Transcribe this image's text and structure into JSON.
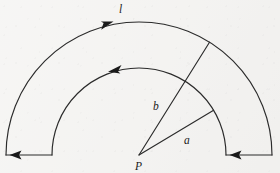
{
  "figure": {
    "type": "geometry-diagram",
    "background_color": "#f4f3f1",
    "ink_color": "#2b2b2b",
    "labels": {
      "arc_length": "l",
      "inner_radius": "a",
      "outer_radius": "b",
      "center_point": "P"
    },
    "geometry": {
      "center": {
        "x": 139,
        "y": 155
      },
      "outer_radius": 133,
      "inner_radius": 87,
      "start_angle_deg": 0,
      "end_angle_deg": 180,
      "radial_line_b_angle_deg": 58,
      "radial_line_a_angle_deg": 31
    },
    "arrows": [
      {
        "name": "outer-arc-arrow",
        "x": 108,
        "y": 25,
        "direction": "clockwise-right"
      },
      {
        "name": "inner-arc-arrow",
        "x": 116,
        "y": 68,
        "direction": "counterclockwise-left"
      },
      {
        "name": "left-edge-arrow",
        "x": 16,
        "y": 155,
        "direction": "left"
      },
      {
        "name": "right-edge-arrow",
        "x": 236,
        "y": 155,
        "direction": "left"
      }
    ],
    "label_positions": {
      "l": {
        "x": 119,
        "y": 13
      },
      "b": {
        "x": 153,
        "y": 110
      },
      "a": {
        "x": 184,
        "y": 144
      },
      "P": {
        "x": 136,
        "y": 169
      }
    }
  }
}
